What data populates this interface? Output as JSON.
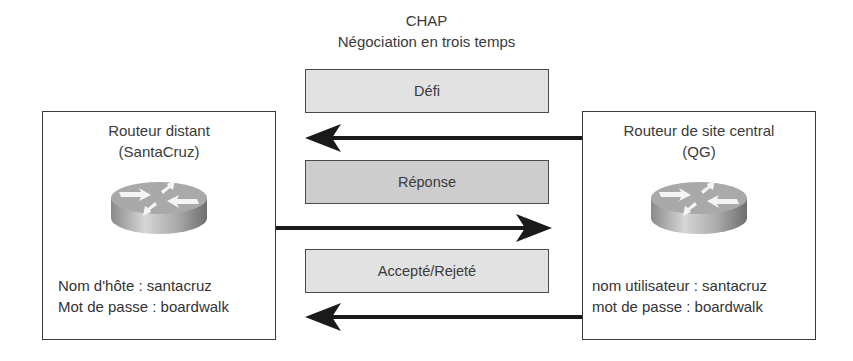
{
  "title": {
    "line1": "CHAP",
    "line2": "Négociation en trois temps"
  },
  "messages": [
    {
      "label": "Défi",
      "direction": "right-to-left"
    },
    {
      "label": "Réponse",
      "direction": "left-to-right"
    },
    {
      "label": "Accepté/Rejeté",
      "direction": "right-to-left"
    }
  ],
  "nodes": {
    "left": {
      "name_line1": "Routeur distant",
      "name_line2": "(SantaCruz)",
      "icon": "router-icon",
      "cred_line1": "Nom d'hôte : santacruz",
      "cred_line2": "Mot de passe : boardwalk"
    },
    "right": {
      "name_line1": "Routeur de site central",
      "name_line2": "(QG)",
      "icon": "router-icon",
      "cred_line1": "nom utilisateur : santacruz",
      "cred_line2": "mot de passe : boardwalk"
    }
  },
  "colors": {
    "border": "#3a3a3a",
    "arrow": "#1a1a1a",
    "box_light": "#e2e2e2",
    "box_dark": "#cdcdcd"
  }
}
